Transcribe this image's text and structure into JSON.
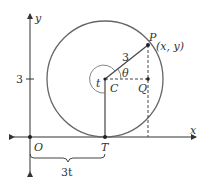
{
  "diagram": {
    "type": "geometry",
    "axes": {
      "x_label": "x",
      "y_label": "y",
      "origin_label": "O",
      "y_tick_label": "3"
    },
    "points": {
      "P": {
        "label": "P",
        "coord_label": "(x, y)"
      },
      "C": {
        "label": "C"
      },
      "Q": {
        "label": "Q"
      },
      "T": {
        "label": "T"
      }
    },
    "labels": {
      "radius": "3",
      "theta": "θ",
      "t_angle": "t",
      "brace": "3t"
    },
    "colors": {
      "circle": "#555555",
      "lines": "#444444",
      "axes": "#333333"
    }
  }
}
